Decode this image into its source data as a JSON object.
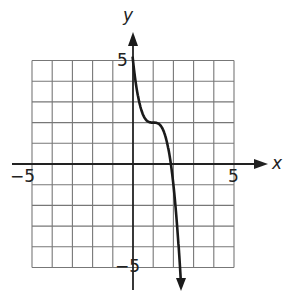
{
  "chart_data": {
    "type": "line",
    "title": "",
    "xlabel": "x",
    "ylabel": "y",
    "xlim": [
      -5,
      5
    ],
    "ylim": [
      -5,
      5
    ],
    "grid": true,
    "tick_labels": {
      "x": [
        "-5",
        "5"
      ],
      "y": [
        "5",
        "-5"
      ]
    },
    "series": [
      {
        "name": "f(x)",
        "description": "Decreasing cubic with horizontal inflection at (1, 2), passing through (0, 5)",
        "points": [
          [
            0,
            5
          ],
          [
            0.5,
            2.4
          ],
          [
            1,
            2
          ],
          [
            1.5,
            1.6
          ],
          [
            1.87,
            0
          ],
          [
            2,
            -1
          ],
          [
            2.2,
            -3.2
          ],
          [
            2.4,
            -6.2
          ]
        ],
        "arrow_up_at_start": true,
        "arrow_down_at_end": true
      }
    ]
  },
  "labels": {
    "x_axis": "x",
    "y_axis": "y",
    "x_min": "−5",
    "x_max": "5",
    "y_max": "5",
    "y_min": "−5"
  }
}
